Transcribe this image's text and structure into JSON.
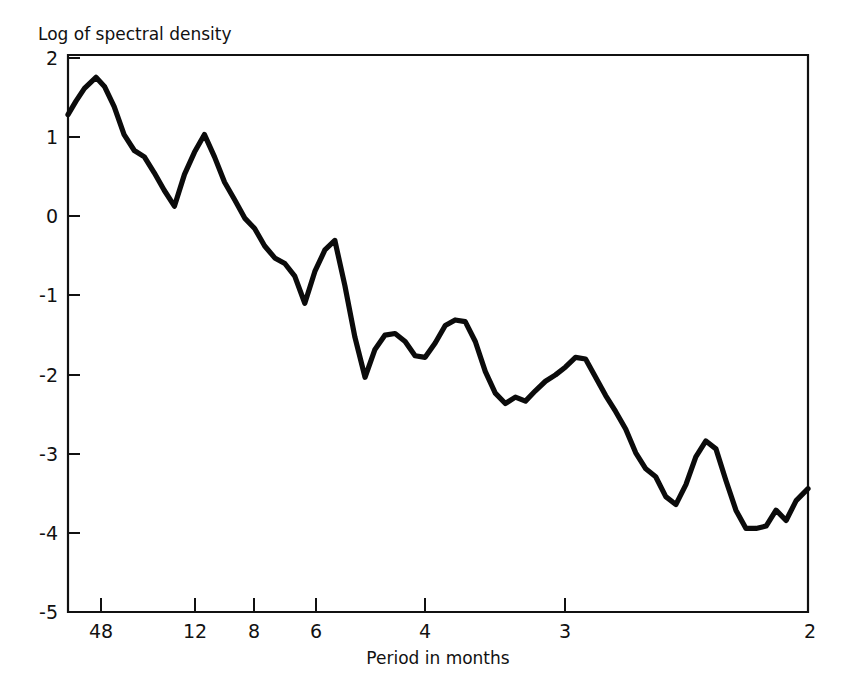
{
  "chart_data": {
    "type": "line",
    "title": "Log of spectral density",
    "xlabel": "Period in months",
    "ylabel": "",
    "xlim": [
      0.0,
      0.5
    ],
    "ylim": [
      -5,
      2
    ],
    "grid": false,
    "legend": null,
    "x_tick_labels": [
      "48",
      "12",
      "8",
      "6",
      "4",
      "3",
      "2"
    ],
    "x_tick_periods": [
      48,
      12,
      8,
      6,
      4,
      3,
      2
    ],
    "x_tick_frequencies": [
      0.0208,
      0.0833,
      0.125,
      0.1667,
      0.25,
      0.3333,
      0.5
    ],
    "y_tick_labels": [
      "2",
      "1",
      "0",
      "-1",
      "-2",
      "-3",
      "-4",
      "-5"
    ],
    "y_tick_values": [
      2,
      1,
      0,
      -1,
      -2,
      -3,
      -4,
      -5
    ],
    "x_axis_note": "frequency axis labelled by period in months (period = 1 / frequency)",
    "series": [
      {
        "name": "log spectral density",
        "color": "#0b0b0b",
        "x": [
          0.0,
          0.0054,
          0.0111,
          0.0189,
          0.0248,
          0.0312,
          0.0379,
          0.0448,
          0.0516,
          0.0583,
          0.065,
          0.0719,
          0.0787,
          0.0855,
          0.0922,
          0.099,
          0.1058,
          0.1126,
          0.1194,
          0.1261,
          0.1329,
          0.1397,
          0.1465,
          0.1532,
          0.16,
          0.1668,
          0.1736,
          0.1803,
          0.1871,
          0.1939,
          0.2007,
          0.2074,
          0.2142,
          0.221,
          0.2278,
          0.2345,
          0.2413,
          0.2481,
          0.2549,
          0.2616,
          0.2684,
          0.2752,
          0.282,
          0.2887,
          0.2955,
          0.3023,
          0.3091,
          0.3158,
          0.3226,
          0.3294,
          0.3362,
          0.3429,
          0.3497,
          0.3565,
          0.3633,
          0.37,
          0.3768,
          0.3836,
          0.3904,
          0.3971,
          0.4039,
          0.4107,
          0.4175,
          0.4242,
          0.431,
          0.4378,
          0.4446,
          0.4513,
          0.4581,
          0.4649,
          0.4717,
          0.4784,
          0.4852,
          0.492,
          0.5
        ],
        "y": [
          1.25,
          1.42,
          1.58,
          1.72,
          1.6,
          1.35,
          1.0,
          0.8,
          0.72,
          0.52,
          0.3,
          0.1,
          0.5,
          0.78,
          1.0,
          0.72,
          0.4,
          0.18,
          -0.05,
          -0.18,
          -0.4,
          -0.55,
          -0.62,
          -0.78,
          -1.12,
          -0.72,
          -0.45,
          -0.33,
          -0.9,
          -1.55,
          -2.05,
          -1.7,
          -1.52,
          -1.5,
          -1.6,
          -1.78,
          -1.8,
          -1.62,
          -1.4,
          -1.33,
          -1.35,
          -1.6,
          -1.98,
          -2.25,
          -2.38,
          -2.3,
          -2.35,
          -2.22,
          -2.1,
          -2.02,
          -1.92,
          -1.8,
          -1.82,
          -2.05,
          -2.28,
          -2.48,
          -2.7,
          -3.0,
          -3.2,
          -3.3,
          -3.55,
          -3.65,
          -3.4,
          -3.05,
          -2.85,
          -2.95,
          -3.35,
          -3.72,
          -3.95,
          -3.95,
          -3.92,
          -3.72,
          -3.85,
          -3.6,
          -3.45
        ]
      }
    ]
  },
  "axes": {
    "title_label": "Log of spectral density",
    "x_axis_label": "Period in months"
  }
}
